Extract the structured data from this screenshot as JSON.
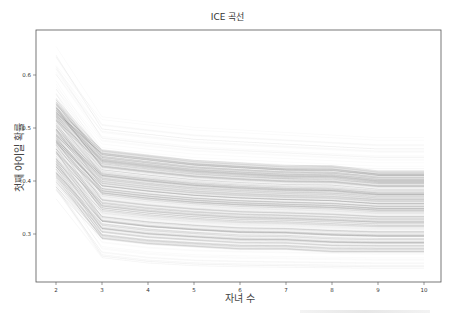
{
  "chart_data": {
    "type": "line",
    "title": "ICE 곡선",
    "xlabel": "자녀 수",
    "ylabel": "첫째 아이일 확률",
    "x": [
      2,
      3,
      4,
      5,
      6,
      7,
      8,
      9,
      10
    ],
    "xticks": [
      "2",
      "3",
      "4",
      "5",
      "6",
      "7",
      "8",
      "9",
      "10"
    ],
    "yticks": [
      "0.3",
      "0.4",
      "0.5",
      "0.6"
    ],
    "ylim": [
      0.21,
      0.685
    ],
    "xlim": [
      1.85,
      10.25
    ],
    "grid": false,
    "legend": null,
    "line_color": "#000000",
    "line_alpha": 0.05,
    "envelope": {
      "upper": [
        0.65,
        0.53,
        0.52,
        0.51,
        0.505,
        0.5,
        0.495,
        0.49,
        0.49
      ],
      "dense_upper": [
        0.55,
        0.46,
        0.45,
        0.44,
        0.435,
        0.43,
        0.43,
        0.42,
        0.42
      ],
      "dense_lower": [
        0.4,
        0.29,
        0.28,
        0.275,
        0.27,
        0.27,
        0.265,
        0.265,
        0.265
      ],
      "lower": [
        0.375,
        0.255,
        0.245,
        0.24,
        0.238,
        0.237,
        0.236,
        0.235,
        0.235
      ]
    }
  }
}
